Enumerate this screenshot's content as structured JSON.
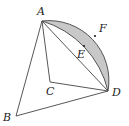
{
  "diagram": {
    "type": "geometry",
    "points": {
      "A": {
        "label": "A",
        "x": 42,
        "y": 21,
        "lx": 37,
        "ly": 15
      },
      "B": {
        "label": "B",
        "x": 16,
        "y": 116,
        "lx": 3,
        "ly": 121
      },
      "C": {
        "label": "C",
        "x": 50,
        "y": 82,
        "lx": 46,
        "ly": 95
      },
      "D": {
        "label": "D",
        "x": 108,
        "y": 91,
        "lx": 112,
        "ly": 96
      },
      "E": {
        "label": "E",
        "x": 84,
        "y": 46,
        "lx": 77,
        "ly": 58
      },
      "F": {
        "label": "F",
        "x": 95,
        "y": 36,
        "lx": 99,
        "ly": 32
      }
    },
    "segments": [
      "AB",
      "BD",
      "AC",
      "CD",
      "AD"
    ],
    "arcs": [
      {
        "name": "arc-AFD",
        "center": "C",
        "radius": 60,
        "through": "F"
      },
      {
        "name": "arc-AED",
        "center": "B",
        "radius": 96,
        "through": "E"
      }
    ],
    "shaded_region": {
      "between": [
        "arc-AFD",
        "arc-AED"
      ],
      "color": "#c8c8c8"
    },
    "stroke_color": "#333333"
  }
}
